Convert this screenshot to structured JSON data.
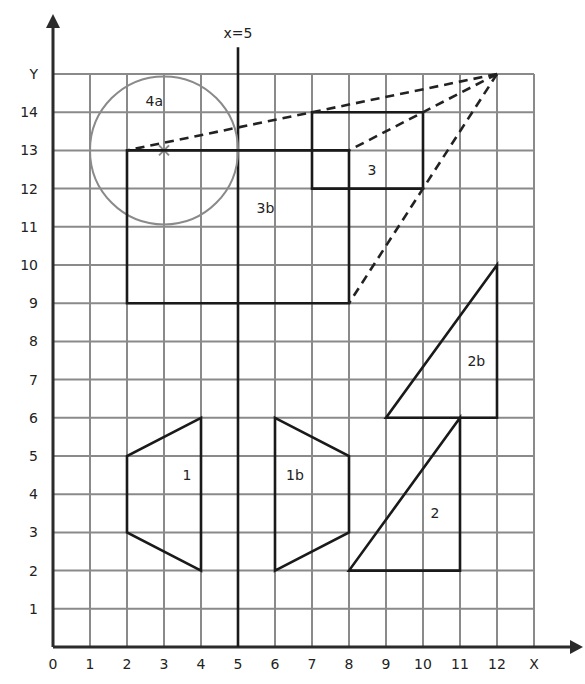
{
  "chart_data": {
    "type": "diagram",
    "title": "",
    "xlabel": "X",
    "ylabel": "Y",
    "xlim": [
      0,
      13
    ],
    "ylim": [
      0,
      15
    ],
    "x_ticks": [
      "0",
      "1",
      "2",
      "3",
      "4",
      "5",
      "6",
      "7",
      "8",
      "9",
      "10",
      "11",
      "12",
      "X"
    ],
    "y_ticks": [
      "1",
      "2",
      "3",
      "4",
      "5",
      "6",
      "7",
      "8",
      "9",
      "10",
      "11",
      "12",
      "13",
      "14",
      "Y"
    ],
    "mirror_line": {
      "label": "x=5",
      "x": 5,
      "y_from": 0,
      "y_to": 15.7
    },
    "shapes": [
      {
        "id": "1",
        "label": "1",
        "label_pos": [
          3.5,
          4.5
        ],
        "points": [
          [
            4,
            6
          ],
          [
            2,
            5
          ],
          [
            2,
            3
          ],
          [
            4,
            2
          ]
        ]
      },
      {
        "id": "1b",
        "label": "1b",
        "label_pos": [
          6.3,
          4.5
        ],
        "points": [
          [
            6,
            6
          ],
          [
            8,
            5
          ],
          [
            8,
            3
          ],
          [
            6,
            2
          ]
        ]
      },
      {
        "id": "2",
        "label": "2",
        "label_pos": [
          10.2,
          3.5
        ],
        "points": [
          [
            8,
            2
          ],
          [
            11,
            2
          ],
          [
            11,
            6
          ]
        ]
      },
      {
        "id": "2b",
        "label": "2b",
        "label_pos": [
          11.2,
          7.5
        ],
        "points": [
          [
            9,
            6
          ],
          [
            12,
            6
          ],
          [
            12,
            10
          ]
        ]
      },
      {
        "id": "3",
        "label": "3",
        "label_pos": [
          8.5,
          12.5
        ],
        "points": [
          [
            7,
            14
          ],
          [
            10,
            14
          ],
          [
            10,
            12
          ],
          [
            7,
            12
          ]
        ]
      },
      {
        "id": "3b",
        "label": "3b",
        "label_pos": [
          5.5,
          11.5
        ],
        "points": [
          [
            2,
            13
          ],
          [
            8,
            13
          ],
          [
            8,
            9
          ],
          [
            2,
            9
          ]
        ]
      }
    ],
    "circle": {
      "id": "4a",
      "label": "4a",
      "label_pos": [
        2.5,
        14.3
      ],
      "center": [
        3,
        13
      ],
      "radius": 2,
      "center_marker": "x"
    },
    "enlargement_center": [
      12,
      15
    ],
    "dashed_rays": [
      [
        [
          12,
          15
        ],
        [
          2,
          13
        ]
      ],
      [
        [
          12,
          15
        ],
        [
          8,
          13
        ]
      ],
      [
        [
          12,
          15
        ],
        [
          8,
          9
        ]
      ]
    ]
  }
}
